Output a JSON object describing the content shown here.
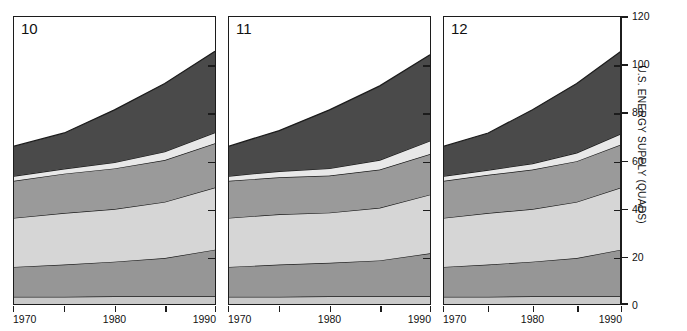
{
  "figure": {
    "y_axis": {
      "title": "U.S. ENERGY SUPPLY (QUADS)",
      "ticks": [
        0,
        20,
        40,
        60,
        80,
        100,
        120
      ],
      "min": 0,
      "max": 120
    },
    "x_axis": {
      "ticks": [
        1970,
        1975,
        1980,
        1985,
        1990
      ],
      "labels": [
        "1970",
        "1980",
        "1990"
      ],
      "min": 1970,
      "max": 1990
    },
    "colors": {
      "band_1": "#c9c9c9",
      "band_2": "#969696",
      "band_3": "#d6d6d6",
      "band_4": "#9a9a9a",
      "band_5": "#e8e8e8",
      "band_6": "#4a4a4a",
      "outline": "#1c1c1c",
      "background": "#ffffff"
    },
    "panels": [
      {
        "id": "panel-10",
        "label": "10"
      },
      {
        "id": "panel-11",
        "label": "11"
      },
      {
        "id": "panel-12",
        "label": "12"
      }
    ]
  },
  "chart_data": {
    "type": "area",
    "title": "",
    "subtitle": "",
    "xlabel": "",
    "ylabel": "U.S. ENERGY SUPPLY (QUADS)",
    "xlim": [
      1970,
      1990
    ],
    "ylim": [
      0,
      120
    ],
    "ytick_labels": [
      "0",
      "20",
      "40",
      "60",
      "80",
      "100",
      "120"
    ],
    "xtick_labels": [
      "1970",
      "1980",
      "1990"
    ],
    "grid": false,
    "legend": "none",
    "stacked": true,
    "x": [
      1970,
      1975,
      1980,
      1985,
      1990
    ],
    "panels": [
      {
        "name": "10",
        "series": [
          {
            "name": "band-1",
            "values": [
              3.0,
              3.0,
              3.2,
              3.2,
              3.2
            ]
          },
          {
            "name": "band-2",
            "values": [
              12.5,
              13.5,
              14.5,
              16.0,
              19.5
            ]
          },
          {
            "name": "band-3",
            "values": [
              20.5,
              21.5,
              22.0,
              23.5,
              26.0
            ]
          },
          {
            "name": "band-4",
            "values": [
              15.5,
              16.5,
              17.0,
              17.5,
              18.5
            ]
          },
          {
            "name": "band-5",
            "values": [
              2.0,
              2.0,
              2.5,
              3.5,
              4.5
            ]
          },
          {
            "name": "band-6",
            "values": [
              12.5,
              15.0,
              22.0,
              28.5,
              34.0
            ]
          }
        ],
        "totals": [
          66.0,
          71.5,
          81.2,
          92.2,
          105.7
        ]
      },
      {
        "name": "11",
        "series": [
          {
            "name": "band-1",
            "values": [
              3.0,
              3.0,
              3.2,
              3.2,
              3.2
            ]
          },
          {
            "name": "band-2",
            "values": [
              12.5,
              13.5,
              14.0,
              15.0,
              18.0
            ]
          },
          {
            "name": "band-3",
            "values": [
              20.5,
              21.0,
              21.0,
              22.0,
              24.5
            ]
          },
          {
            "name": "band-4",
            "values": [
              15.5,
              15.5,
              15.5,
              16.0,
              17.0
            ]
          },
          {
            "name": "band-5",
            "values": [
              2.0,
              2.5,
              3.0,
              4.0,
              5.5
            ]
          },
          {
            "name": "band-6",
            "values": [
              12.5,
              17.0,
              24.5,
              31.0,
              36.0
            ]
          }
        ],
        "totals": [
          66.0,
          72.5,
          81.2,
          91.2,
          104.2
        ]
      },
      {
        "name": "12",
        "series": [
          {
            "name": "band-1",
            "values": [
              3.0,
              3.0,
              3.2,
              3.2,
              3.2
            ]
          },
          {
            "name": "band-2",
            "values": [
              12.5,
              13.5,
              14.5,
              16.0,
              19.5
            ]
          },
          {
            "name": "band-3",
            "values": [
              20.5,
              21.5,
              22.0,
              23.5,
              26.0
            ]
          },
          {
            "name": "band-4",
            "values": [
              15.5,
              16.0,
              16.5,
              17.0,
              18.0
            ]
          },
          {
            "name": "band-5",
            "values": [
              2.0,
              2.0,
              2.5,
              3.5,
              4.5
            ]
          },
          {
            "name": "band-6",
            "values": [
              12.5,
              15.5,
              22.5,
              29.0,
              34.5
            ]
          }
        ],
        "totals": [
          66.0,
          71.5,
          81.2,
          92.2,
          105.7
        ]
      }
    ]
  }
}
